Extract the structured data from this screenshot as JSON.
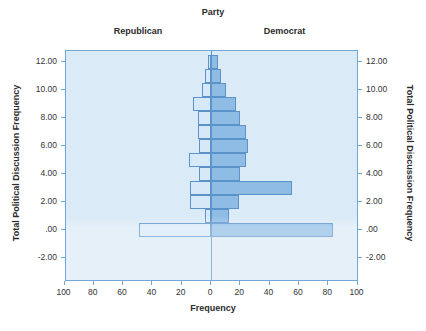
{
  "chart_data": {
    "type": "bar",
    "subtype": "population-pyramid",
    "title": "Party",
    "panel_labels": [
      "Republican",
      "Democrat"
    ],
    "xlabel": "Frequency",
    "ylabel": "Total Political Discussion Frequency",
    "ylabel_right": "Total Political Discussion Frequency",
    "xticks": [
      "100",
      "80",
      "60",
      "40",
      "20",
      "0",
      "20",
      "40",
      "60",
      "80",
      "100"
    ],
    "xtick_values": [
      -100,
      -80,
      -60,
      -40,
      -20,
      0,
      20,
      40,
      60,
      80,
      100
    ],
    "yticks": [
      "12.00",
      "10.00",
      "8.00",
      "6.00",
      "4.00",
      "2.00",
      ".00",
      "-2.00"
    ],
    "ytick_values": [
      12,
      10,
      8,
      6,
      4,
      2,
      0,
      -2
    ],
    "xlim": [
      -110,
      110
    ],
    "ylim": [
      -3,
      13.2
    ],
    "grid": false,
    "legend": "none",
    "categories": [
      0,
      1,
      2,
      3,
      4,
      5,
      6,
      7,
      8,
      9,
      10,
      11,
      12
    ],
    "series": [
      {
        "name": "Republican",
        "side": "left",
        "color": "#d6e9f8",
        "values": [
          49,
          4,
          14,
          14,
          8,
          15,
          8,
          9,
          9,
          12,
          6,
          4,
          2
        ]
      },
      {
        "name": "Democrat",
        "side": "right",
        "color": "#7aaee0",
        "values": [
          83,
          12,
          19,
          55,
          20,
          24,
          25,
          24,
          20,
          17,
          10,
          7,
          5
        ]
      }
    ]
  },
  "colors": {
    "plot_background": "#daeaf7",
    "plot_border": "#6fa8d6",
    "bar_outline": "#5b93c9",
    "bar_left_fill": "#d6e9f8",
    "bar_right_fill": "#7aaee0",
    "zero_line": "#5b93c9",
    "text": "#2b2b2b"
  }
}
